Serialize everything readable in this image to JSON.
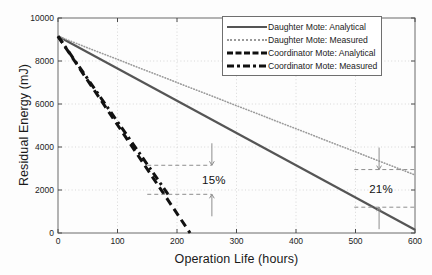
{
  "chart_data": {
    "type": "line",
    "title": "",
    "xlabel": "Operation Life (hours)",
    "ylabel": "Residual Energy (mJ)",
    "xlim": [
      0,
      600
    ],
    "ylim": [
      0,
      10000
    ],
    "xticks": [
      0,
      100,
      200,
      300,
      400,
      500,
      600
    ],
    "yticks": [
      0,
      2000,
      4000,
      6000,
      8000,
      10000
    ],
    "xtick_labels": [
      "0",
      "100",
      "200",
      "300",
      "400",
      "500",
      "600"
    ],
    "ytick_labels": [
      "0",
      "2000",
      "4000",
      "6000",
      "8000",
      "10000"
    ],
    "grid": true,
    "legend_position": "top-right",
    "series": [
      {
        "name": "Daughter Mote: Analytical",
        "style": "solid",
        "color": "#555555",
        "x": [
          0,
          600
        ],
        "y": [
          9150,
          150
        ]
      },
      {
        "name": "Daughter Mote: Measured",
        "style": "dotted",
        "color": "#9a9a9a",
        "x": [
          0,
          600
        ],
        "y": [
          9150,
          2700
        ]
      },
      {
        "name": "Coordinator Mote: Analytical",
        "style": "dashed",
        "color": "#111111",
        "x": [
          0,
          222
        ],
        "y": [
          9150,
          0
        ]
      },
      {
        "name": "Coordinator Mote: Measured",
        "style": "dashdot",
        "color": "#111111",
        "x": [
          0,
          185
        ],
        "y": [
          9150,
          1800
        ]
      }
    ],
    "annotations": [
      {
        "label": "15%",
        "x": 262,
        "y": 2450,
        "guide_upper_y": 3150,
        "guide_lower_y": 1800,
        "guide_x_start": 150,
        "guide_x_end": 258
      },
      {
        "label": "21%",
        "x": 543,
        "y": 2050,
        "guide_upper_y": 2950,
        "guide_lower_y": 1200,
        "guide_x_start": 498,
        "guide_x_end": 600
      }
    ]
  },
  "legend": {
    "items": [
      {
        "label": "Daughter Mote: Analytical"
      },
      {
        "label": "Daughter Mote: Measured"
      },
      {
        "label": "Coordinator Mote: Analytical"
      },
      {
        "label": "Coordinator Mote: Measured"
      }
    ]
  }
}
